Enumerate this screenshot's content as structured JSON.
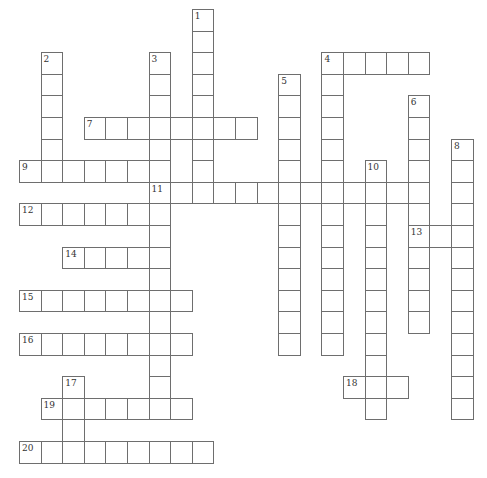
{
  "puzzle": {
    "type": "crossword",
    "grid_origin": {
      "x": 19,
      "y": 9
    },
    "cell_pitch": 21.6,
    "colors": {
      "line": "#6e6e6e",
      "background": "#ffffff",
      "number": "#333333"
    },
    "across": [
      {
        "number": "4",
        "row": 2,
        "col": 14,
        "length": 5
      },
      {
        "number": "7",
        "row": 5,
        "col": 3,
        "length": 8
      },
      {
        "number": "9",
        "row": 7,
        "col": 0,
        "length": 7
      },
      {
        "number": "11",
        "row": 8,
        "col": 6,
        "length": 13
      },
      {
        "number": "12",
        "row": 9,
        "col": 0,
        "length": 7
      },
      {
        "number": "13",
        "row": 10,
        "col": 18,
        "length": 3
      },
      {
        "number": "14",
        "row": 11,
        "col": 2,
        "length": 5
      },
      {
        "number": "15",
        "row": 13,
        "col": 0,
        "length": 8
      },
      {
        "number": "16",
        "row": 15,
        "col": 0,
        "length": 8
      },
      {
        "number": "18",
        "row": 17,
        "col": 15,
        "length": 3
      },
      {
        "number": "19",
        "row": 18,
        "col": 1,
        "length": 7
      },
      {
        "number": "20",
        "row": 20,
        "col": 0,
        "length": 9
      }
    ],
    "down": [
      {
        "number": "1",
        "row": 0,
        "col": 8,
        "length": 9
      },
      {
        "number": "2",
        "row": 2,
        "col": 1,
        "length": 6
      },
      {
        "number": "3",
        "row": 2,
        "col": 6,
        "length": 17
      },
      {
        "number": "4",
        "row": 2,
        "col": 14,
        "length": 14
      },
      {
        "number": "5",
        "row": 3,
        "col": 12,
        "length": 13
      },
      {
        "number": "6",
        "row": 4,
        "col": 18,
        "length": 11
      },
      {
        "number": "8",
        "row": 6,
        "col": 20,
        "length": 13
      },
      {
        "number": "10",
        "row": 7,
        "col": 16,
        "length": 12
      },
      {
        "number": "17",
        "row": 17,
        "col": 2,
        "length": 4
      }
    ]
  }
}
